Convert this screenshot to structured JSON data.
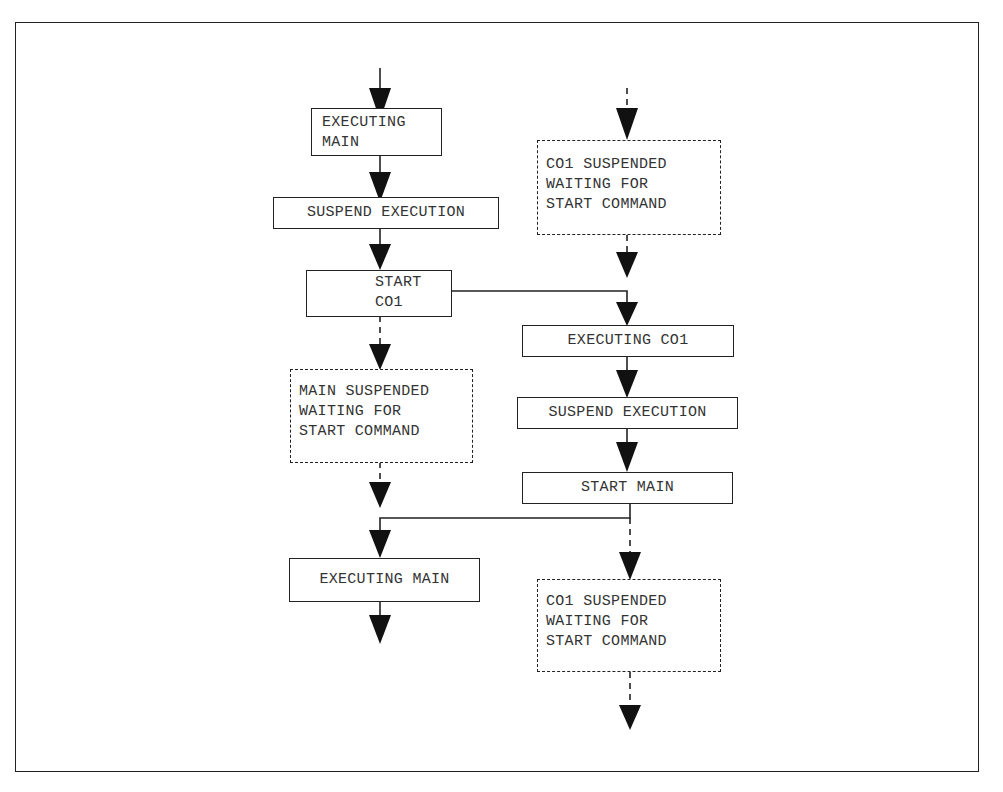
{
  "diagram": {
    "type": "flowchart",
    "columns": [
      "MAIN",
      "CO1"
    ],
    "nodes": {
      "main_exec_1": "EXECUTING\nMAIN",
      "main_suspend": "SUSPEND EXECUTION",
      "main_start_co1": "START\nCO1",
      "main_wait": "MAIN SUSPENDED\nWAITING FOR\nSTART COMMAND",
      "main_exec_2": "EXECUTING MAIN",
      "co1_wait_1": "CO1 SUSPENDED\nWAITING FOR\nSTART COMMAND",
      "co1_exec": "EXECUTING CO1",
      "co1_suspend": "SUSPEND EXECUTION",
      "co1_start_main": "START MAIN",
      "co1_wait_2": "CO1 SUSPENDED\nWAITING FOR\nSTART COMMAND"
    },
    "edges": [
      {
        "from": "entry",
        "to": "main_exec_1",
        "style": "solid"
      },
      {
        "from": "main_exec_1",
        "to": "main_suspend",
        "style": "solid"
      },
      {
        "from": "main_suspend",
        "to": "main_start_co1",
        "style": "solid"
      },
      {
        "from": "main_start_co1",
        "to": "main_wait",
        "style": "dashed"
      },
      {
        "from": "main_start_co1",
        "to": "co1_exec",
        "style": "solid"
      },
      {
        "from": "main_wait",
        "to": "main_exec_2",
        "style": "dashed"
      },
      {
        "from": "main_exec_2",
        "to": "exit",
        "style": "solid"
      },
      {
        "from": "entry",
        "to": "co1_wait_1",
        "style": "dashed"
      },
      {
        "from": "co1_wait_1",
        "to": "co1_exec",
        "style": "dashed"
      },
      {
        "from": "co1_exec",
        "to": "co1_suspend",
        "style": "solid"
      },
      {
        "from": "co1_suspend",
        "to": "co1_start_main",
        "style": "solid"
      },
      {
        "from": "co1_start_main",
        "to": "main_exec_2",
        "style": "solid"
      },
      {
        "from": "co1_start_main",
        "to": "co1_wait_2",
        "style": "dashed"
      },
      {
        "from": "co1_wait_2",
        "to": "exit",
        "style": "dashed"
      }
    ]
  }
}
